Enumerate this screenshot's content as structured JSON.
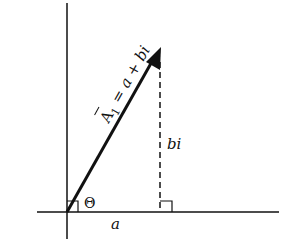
{
  "diagram": {
    "type": "complex-plane-vector",
    "vector_label": {
      "symbol": "A",
      "subscript": "1",
      "equals": " = ",
      "expr_a": "a",
      "plus": " + ",
      "expr_bi": "bi"
    },
    "imag_component_label": "bi",
    "real_component_label": "a",
    "angle_label": "Θ",
    "colors": {
      "ink": "#111111",
      "background": "#ffffff"
    }
  }
}
